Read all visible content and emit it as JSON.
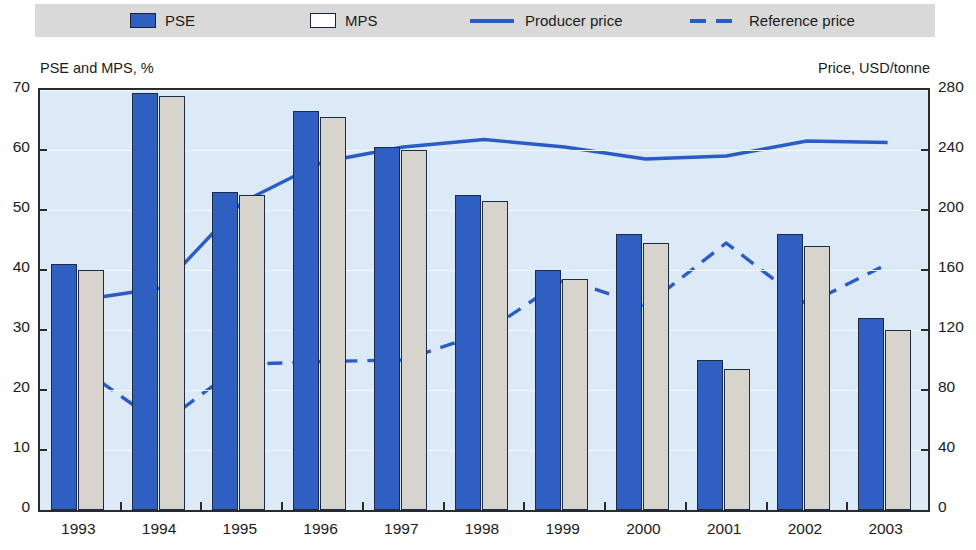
{
  "legend": {
    "items": [
      {
        "label": "PSE",
        "type": "swatch-filled",
        "color": "#2f5fc0"
      },
      {
        "label": "MPS",
        "type": "swatch-open",
        "color": "#ffffff"
      },
      {
        "label": "Producer price",
        "type": "line-solid",
        "color": "#2a5cc4"
      },
      {
        "label": "Reference price",
        "type": "line-dashed",
        "color": "#2a5cc4"
      }
    ]
  },
  "axis_captions": {
    "left": "PSE and MPS, %",
    "right": "Price, USD/tonne"
  },
  "y_left_ticks": [
    "0",
    "10",
    "20",
    "30",
    "40",
    "50",
    "60",
    "70"
  ],
  "y_right_ticks": [
    "0",
    "40",
    "80",
    "120",
    "160",
    "200",
    "240",
    "280"
  ],
  "colors": {
    "bar_pse": "#2f5fc0",
    "bar_mps": "#d6d4cc",
    "line": "#2a5cc4",
    "plot_bg": "#dce9f7",
    "legend_bg": "#d9d9d9",
    "axis": "#2b2b2b"
  },
  "chart_data": {
    "type": "bar",
    "title": "",
    "xlabel": "",
    "ylabel": "PSE and MPS, %",
    "y2label": "Price, USD/tonne",
    "ylim": [
      0,
      70
    ],
    "y2lim": [
      0,
      280
    ],
    "ytick_step": 10,
    "y2tick_step": 40,
    "grid": true,
    "legend_position": "top",
    "categories": [
      "1993",
      "1994",
      "1995",
      "1996",
      "1997",
      "1998",
      "1999",
      "2000",
      "2001",
      "2002",
      "2003"
    ],
    "series": [
      {
        "name": "PSE",
        "axis": "left",
        "unit": "%",
        "kind": "bar",
        "values": [
          41,
          69.5,
          53,
          66.5,
          60.5,
          52.5,
          40,
          46,
          25,
          46,
          32
        ]
      },
      {
        "name": "MPS",
        "axis": "left",
        "unit": "%",
        "kind": "bar",
        "values": [
          40,
          69,
          52.5,
          65.5,
          60,
          51.5,
          38.5,
          44.5,
          23.5,
          44,
          30
        ]
      },
      {
        "name": "Producer price",
        "axis": "right",
        "unit": "USD/tonne",
        "kind": "line-solid",
        "values": [
          140,
          148,
          205,
          232,
          242,
          247,
          242,
          234,
          236,
          246,
          245
        ]
      },
      {
        "name": "Reference price",
        "axis": "right",
        "unit": "USD/tonne",
        "kind": "line-dashed",
        "values": [
          95,
          57,
          97,
          99,
          100,
          118,
          154,
          136,
          178,
          137,
          164
        ]
      }
    ]
  }
}
